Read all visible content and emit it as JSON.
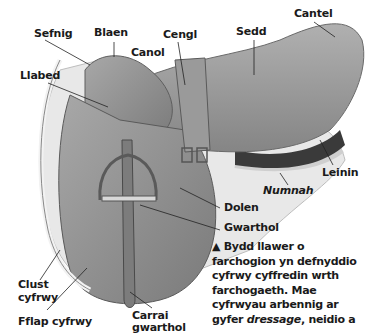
{
  "diagram": {
    "colors": {
      "leather": "#8e8e8e",
      "leather_dark": "#6a6a6a",
      "leather_light": "#b4b4b4",
      "numnah": "#e6e6e6",
      "label": "#1a1a1a",
      "leader": "#222222"
    },
    "labels": {
      "sefnig": "Sefnig",
      "blaen": "Blaen",
      "canol": "Canol",
      "cengl": "Cengl",
      "sedd": "Sedd",
      "cantel": "Cantel",
      "llabed": "Llabed",
      "leinin": "Leinin",
      "numnah": "Numnah",
      "dolen": "Dolen",
      "gwarthol": "Gwarthol",
      "clust_cyfrwy_1": "Clust",
      "clust_cyfrwy_2": "cyfrwy",
      "fflap_cyfrwy": "Fflap cyfrwy",
      "carrai_gwarthol_1": "Carrai",
      "carrai_gwarthol_2": "gwarthol"
    },
    "caption": {
      "marker": "▲",
      "line1": "Bydd llawer o",
      "line2": "farchogion yn defnyddio",
      "line3": "cyfrwy cyffredin wrth",
      "line4": "farchogaeth. Mae",
      "line5": "cyfrwyau arbennig ar",
      "line6_pre": "gyfer ",
      "line6_italic": "dressage",
      "line6_post": ", neidio a"
    }
  }
}
